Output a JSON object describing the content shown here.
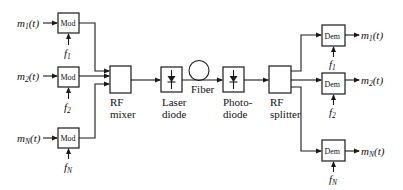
{
  "diagram": {
    "type": "block-diagram",
    "title": "",
    "inputs": [
      {
        "signal": "m",
        "sub": "1",
        "arg": "(t)",
        "carrier": "f",
        "carrier_sub": "1",
        "block": "Mod"
      },
      {
        "signal": "m",
        "sub": "2",
        "arg": "(t)",
        "carrier": "f",
        "carrier_sub": "2",
        "block": "Mod"
      },
      {
        "signal": "m",
        "sub": "N",
        "arg": "(t)",
        "carrier": "f",
        "carrier_sub": "N",
        "block": "Mod"
      }
    ],
    "chain": [
      {
        "id": "rf-mixer",
        "line1": "RF",
        "line2": "mixer"
      },
      {
        "id": "laser-diode",
        "line1": "Laser",
        "line2": "diode"
      },
      {
        "id": "fiber",
        "line1": "Fiber"
      },
      {
        "id": "photodiode",
        "line1": "Photo-",
        "line2": "diode"
      },
      {
        "id": "rf-splitter",
        "line1": "RF",
        "line2": "splitter"
      }
    ],
    "outputs": [
      {
        "signal": "m",
        "sub": "1",
        "arg": "(t)",
        "carrier": "f",
        "carrier_sub": "1",
        "block": "Dem"
      },
      {
        "signal": "m",
        "sub": "2",
        "arg": "(t)",
        "carrier": "f",
        "carrier_sub": "2",
        "block": "Dem"
      },
      {
        "signal": "m",
        "sub": "N",
        "arg": "(t)",
        "carrier": "f",
        "carrier_sub": "N",
        "block": "Dem"
      }
    ]
  }
}
